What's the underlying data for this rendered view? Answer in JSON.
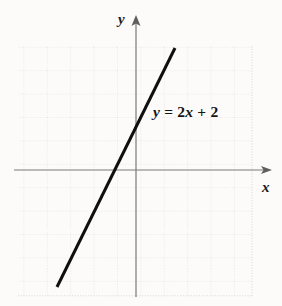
{
  "figure": {
    "background_color": "#fcfbf9",
    "width": 282,
    "height": 306
  },
  "axes": {
    "x_label": "x",
    "y_label": "y",
    "axis_color": "#7a7a7a",
    "origin_px": {
      "x": 135,
      "y": 170
    },
    "x_axis_start_px": {
      "x": 14,
      "y": 170
    },
    "x_axis_end_px": {
      "x": 272,
      "y": 170
    },
    "y_axis_start_px": {
      "x": 136,
      "y": 297
    },
    "y_axis_end_px": {
      "x": 136,
      "y": 16
    },
    "arrowheads": [
      "x-positive",
      "y-positive"
    ]
  },
  "grid": {
    "visible": true,
    "style": "dotted",
    "color": "#dedad2",
    "spacing_px": 23.4,
    "left_px": 18,
    "top_px": 46,
    "right_px": 252,
    "bottom_px": 296
  },
  "annotation": {
    "equation_text": "y = 2x + 2",
    "equation_parts": {
      "y": "y",
      "equals": " = ",
      "coefficient": "2",
      "x": "x",
      "plus": " + ",
      "constant": "2"
    },
    "color": "#151515",
    "position_px": {
      "x": 153,
      "y": 103
    }
  },
  "chart_data": {
    "type": "line",
    "title": "",
    "xlabel": "x",
    "ylabel": "y",
    "grid": true,
    "legend": "none",
    "annotations": [
      "y = 2x + 2"
    ],
    "series": [
      {
        "name": "y = 2x + 2",
        "equation": "y = 2x + 2",
        "slope": 2,
        "intercept": 2,
        "color": "#0f0f0f",
        "linewidth_px": 3,
        "x": [
          -3.3,
          1.7
        ],
        "y": [
          -4.6,
          5.4
        ],
        "endpoints_px": [
          {
            "x": 57,
            "y": 287
          },
          {
            "x": 175,
            "y": 48
          }
        ],
        "x_intercept": -1,
        "y_intercept": 2,
        "y_intercept_px": {
          "x": 135,
          "y": 123
        },
        "x_intercept_px": {
          "x": 113,
          "y": 170
        }
      }
    ],
    "xlim": [
      -5.0,
      5.8
    ],
    "ylim": [
      -5.3,
      5.2
    ],
    "unit_px": 23.4
  }
}
